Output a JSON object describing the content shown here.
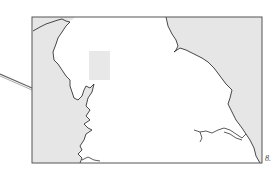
{
  "map": {
    "frame": {
      "x": 32,
      "y": 17,
      "width": 230,
      "height": 146
    },
    "colors": {
      "sea": "#e6e6e6",
      "land": "#ffffff",
      "coastline": "#333333",
      "frame": "#555555",
      "inset": "#e8e8e8"
    },
    "inset_box": {
      "x": 89,
      "y": 51,
      "width": 21,
      "height": 29
    },
    "pointer_line": {
      "from": [
        0,
        75
      ],
      "to": [
        32,
        89
      ]
    }
  },
  "figure": {
    "label": "8."
  }
}
